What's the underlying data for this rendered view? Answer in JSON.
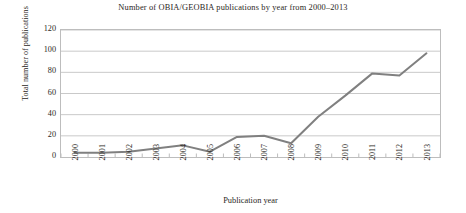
{
  "chart_data": {
    "type": "line",
    "title": "Number of OBIA/GEOBIA publications by year from 2000–2013",
    "xlabel": "Publication year",
    "ylabel": "Total number of publications",
    "categories": [
      "2000",
      "2001",
      "2002",
      "2003",
      "2004",
      "2005",
      "2006",
      "2007",
      "2008",
      "2009",
      "2010",
      "2011",
      "2012",
      "2013"
    ],
    "x": [
      2000,
      2001,
      2002,
      2003,
      2004,
      2005,
      2006,
      2007,
      2008,
      2009,
      2010,
      2011,
      2012,
      2013
    ],
    "values": [
      4,
      4,
      5,
      8,
      11,
      5,
      19,
      20,
      13,
      38,
      58,
      79,
      77,
      98
    ],
    "series": [
      {
        "name": "Total number of publications",
        "values": [
          4,
          4,
          5,
          8,
          11,
          5,
          19,
          20,
          13,
          38,
          58,
          79,
          77,
          98
        ]
      }
    ],
    "ylim": [
      0,
      120
    ],
    "yticks": [
      0,
      20,
      40,
      60,
      80,
      100,
      120
    ],
    "ytick_labels": [
      "0",
      "20",
      "40",
      "60",
      "80",
      "100",
      "120"
    ],
    "grid": "horizontal",
    "legend": "none",
    "line_color": "#808080",
    "gridline_color": "#c9c9c9",
    "background_color": "#ffffff"
  }
}
